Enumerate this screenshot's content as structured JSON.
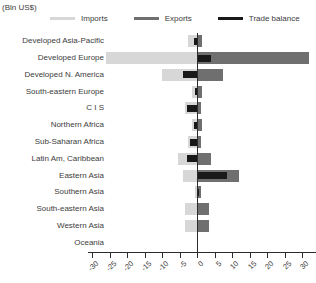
{
  "header": {
    "units_label": "(Bln US$)"
  },
  "chart_data": {
    "type": "bar",
    "orientation": "horizontal",
    "title": "",
    "units": "(Bln US$)",
    "legend_position": "top",
    "grid": false,
    "xlim": [
      -30,
      35
    ],
    "x_ticks": [
      -30,
      -25,
      -20,
      -15,
      -10,
      -5,
      0,
      5,
      10,
      15,
      20,
      25,
      30,
      35
    ],
    "categories": [
      "Developed Asia-Pacific",
      "Developed Europe",
      "Developed N. America",
      "South-eastern Europe",
      "C I S",
      "Northern Africa",
      "Sub-Saharan Africa",
      "Latin Am, Caribbean",
      "Eastern Asia",
      "Southern Asia",
      "South-eastern Asia",
      "Western Asia",
      "Oceania"
    ],
    "series": [
      {
        "name": "Imports",
        "color": "#d7d7d7",
        "values": [
          -2.5,
          -26,
          -10,
          -1.5,
          -3.5,
          -1.5,
          -2.5,
          -5.5,
          -4,
          -0.5,
          -3.5,
          -3.5,
          0
        ]
      },
      {
        "name": "Exports",
        "color": "#6f6f6f",
        "values": [
          1.5,
          32,
          7.5,
          1.5,
          1,
          1.5,
          1,
          4,
          12,
          1,
          3.5,
          3.5,
          0
        ]
      },
      {
        "name": "Trade balance",
        "color": "#191919",
        "values": [
          -1,
          4,
          -4,
          -0.5,
          -3,
          -1,
          -2,
          -3,
          8.5,
          0.7,
          0,
          0,
          0
        ]
      }
    ],
    "colors": {
      "axis": "#2b2b2b",
      "text": "#3d3d3d",
      "background": "#ffffff"
    }
  }
}
